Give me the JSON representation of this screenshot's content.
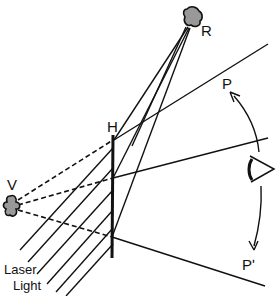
{
  "diagram": {
    "type": "holography-reconstruction",
    "labels": {
      "hologram": "H",
      "real_image": "R",
      "virtual_image": "V",
      "viewpoint_upper": "P",
      "viewpoint_lower": "Pʹ",
      "laser_line1": "Laser",
      "laser_line2": "Light"
    },
    "icons": {
      "real_image": "blob-object-icon",
      "virtual_image": "blob-object-icon",
      "eye": "eye-icon"
    },
    "colors": {
      "ink": "#111111",
      "background": "#ffffff"
    }
  }
}
